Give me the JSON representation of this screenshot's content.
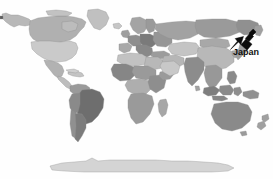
{
  "figure": {
    "type": "world-choropleth-map",
    "projection": "equirectangular-world",
    "background_color": "#fefefe",
    "border_color": "#8e8e8e",
    "width_px": 273,
    "height_px": 179
  },
  "annotation": {
    "label": "Japan",
    "label_color": "#101010",
    "arrow_color": "#0b0b0b",
    "arrow_direction": "down-left",
    "arrow_tip": {
      "x": 231,
      "y": 49
    },
    "arrow_tail": {
      "x": 251,
      "y": 29
    },
    "label_position": {
      "x": 233,
      "y": 47
    }
  },
  "legend_shades": {
    "lightest": "#dcdcdc",
    "light": "#c8c8c8",
    "medium_light": "#b4b4b4",
    "medium": "#a0a0a0",
    "medium_dark": "#8c8c8c",
    "dark": "#787878",
    "darkest": "#646464"
  },
  "regions": [
    {
      "name": "greenland",
      "shade": "#c0c0c0"
    },
    {
      "name": "canada",
      "shade": "#b0b0b0"
    },
    {
      "name": "alaska",
      "shade": "#b8b8b8"
    },
    {
      "name": "united-states",
      "shade": "#cacaca"
    },
    {
      "name": "mexico",
      "shade": "#b2b2b2"
    },
    {
      "name": "central-america",
      "shade": "#bdbdbd"
    },
    {
      "name": "caribbean",
      "shade": "#c4c4c4"
    },
    {
      "name": "colombia-venezuela",
      "shade": "#9a9a9a"
    },
    {
      "name": "brazil",
      "shade": "#6e6e6e"
    },
    {
      "name": "peru-bolivia",
      "shade": "#8a8a8a"
    },
    {
      "name": "argentina-chile",
      "shade": "#7c7c7c"
    },
    {
      "name": "iceland",
      "shade": "#c6c6c6"
    },
    {
      "name": "scandinavia",
      "shade": "#a4a4a4"
    },
    {
      "name": "british-isles",
      "shade": "#9e9e9e"
    },
    {
      "name": "western-europe",
      "shade": "#8e8e8e"
    },
    {
      "name": "central-europe",
      "shade": "#7a7a7a"
    },
    {
      "name": "eastern-europe",
      "shade": "#969696"
    },
    {
      "name": "iberia",
      "shade": "#a8a8a8"
    },
    {
      "name": "italy-balkans",
      "shade": "#888888"
    },
    {
      "name": "turkey",
      "shade": "#9c9c9c"
    },
    {
      "name": "north-africa",
      "shade": "#c2c2c2"
    },
    {
      "name": "sahel",
      "shade": "#9a9a9a"
    },
    {
      "name": "west-africa",
      "shade": "#868686"
    },
    {
      "name": "central-africa",
      "shade": "#aeaeae"
    },
    {
      "name": "east-africa",
      "shade": "#8e8e8e"
    },
    {
      "name": "southern-africa",
      "shade": "#9a9a9a"
    },
    {
      "name": "madagascar",
      "shade": "#a6a6a6"
    },
    {
      "name": "middle-east",
      "shade": "#b6b6b6"
    },
    {
      "name": "arabian-peninsula",
      "shade": "#c8c8c8"
    },
    {
      "name": "russia",
      "shade": "#a2a2a2"
    },
    {
      "name": "siberia",
      "shade": "#9a9a9a"
    },
    {
      "name": "central-asia",
      "shade": "#c4c4c4"
    },
    {
      "name": "china",
      "shade": "#b8b8b8"
    },
    {
      "name": "mongolia",
      "shade": "#a8a8a8"
    },
    {
      "name": "india",
      "shade": "#8c8c8c"
    },
    {
      "name": "southeast-asia",
      "shade": "#989898"
    },
    {
      "name": "indonesia",
      "shade": "#7e7e7e"
    },
    {
      "name": "philippines",
      "shade": "#8a8a8a"
    },
    {
      "name": "japan",
      "shade": "#9e9e9e"
    },
    {
      "name": "korea",
      "shade": "#a6a6a6"
    },
    {
      "name": "australia",
      "shade": "#8a8a8a"
    },
    {
      "name": "new-zealand",
      "shade": "#a0a0a0"
    },
    {
      "name": "papua-new-guinea",
      "shade": "#909090"
    },
    {
      "name": "antarctica",
      "shade": "#d4d4d4"
    }
  ]
}
